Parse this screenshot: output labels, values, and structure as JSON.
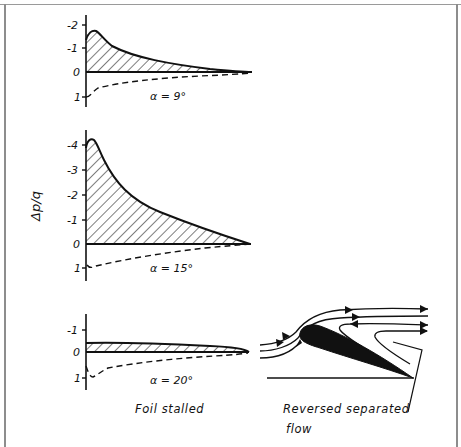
{
  "figure": {
    "y_axis_label": "Δp/q",
    "panels": [
      {
        "id": "alpha-9",
        "alpha_label": "α = 9°",
        "tick_labels": [
          "-2",
          "-1",
          "0",
          "1"
        ],
        "suction_peak": -1.7,
        "pressure_le": 1.0
      },
      {
        "id": "alpha-15",
        "alpha_label": "α = 15°",
        "tick_labels": [
          "-4",
          "-3",
          "-2",
          "-1",
          "0",
          "1"
        ],
        "suction_peak": -4.3,
        "pressure_le": 1.0
      },
      {
        "id": "alpha-20",
        "alpha_label": "α = 20°",
        "tick_labels": [
          "-1",
          "0",
          "1"
        ],
        "suction_peak": -0.4,
        "pressure_le": 1.0
      }
    ],
    "captions": {
      "left": "Foil stalled",
      "right_line1": "Reversed separated",
      "right_line2": "flow"
    },
    "legend_notes": {
      "solid_hatched": "suction side",
      "dashed": "pressure side"
    }
  }
}
